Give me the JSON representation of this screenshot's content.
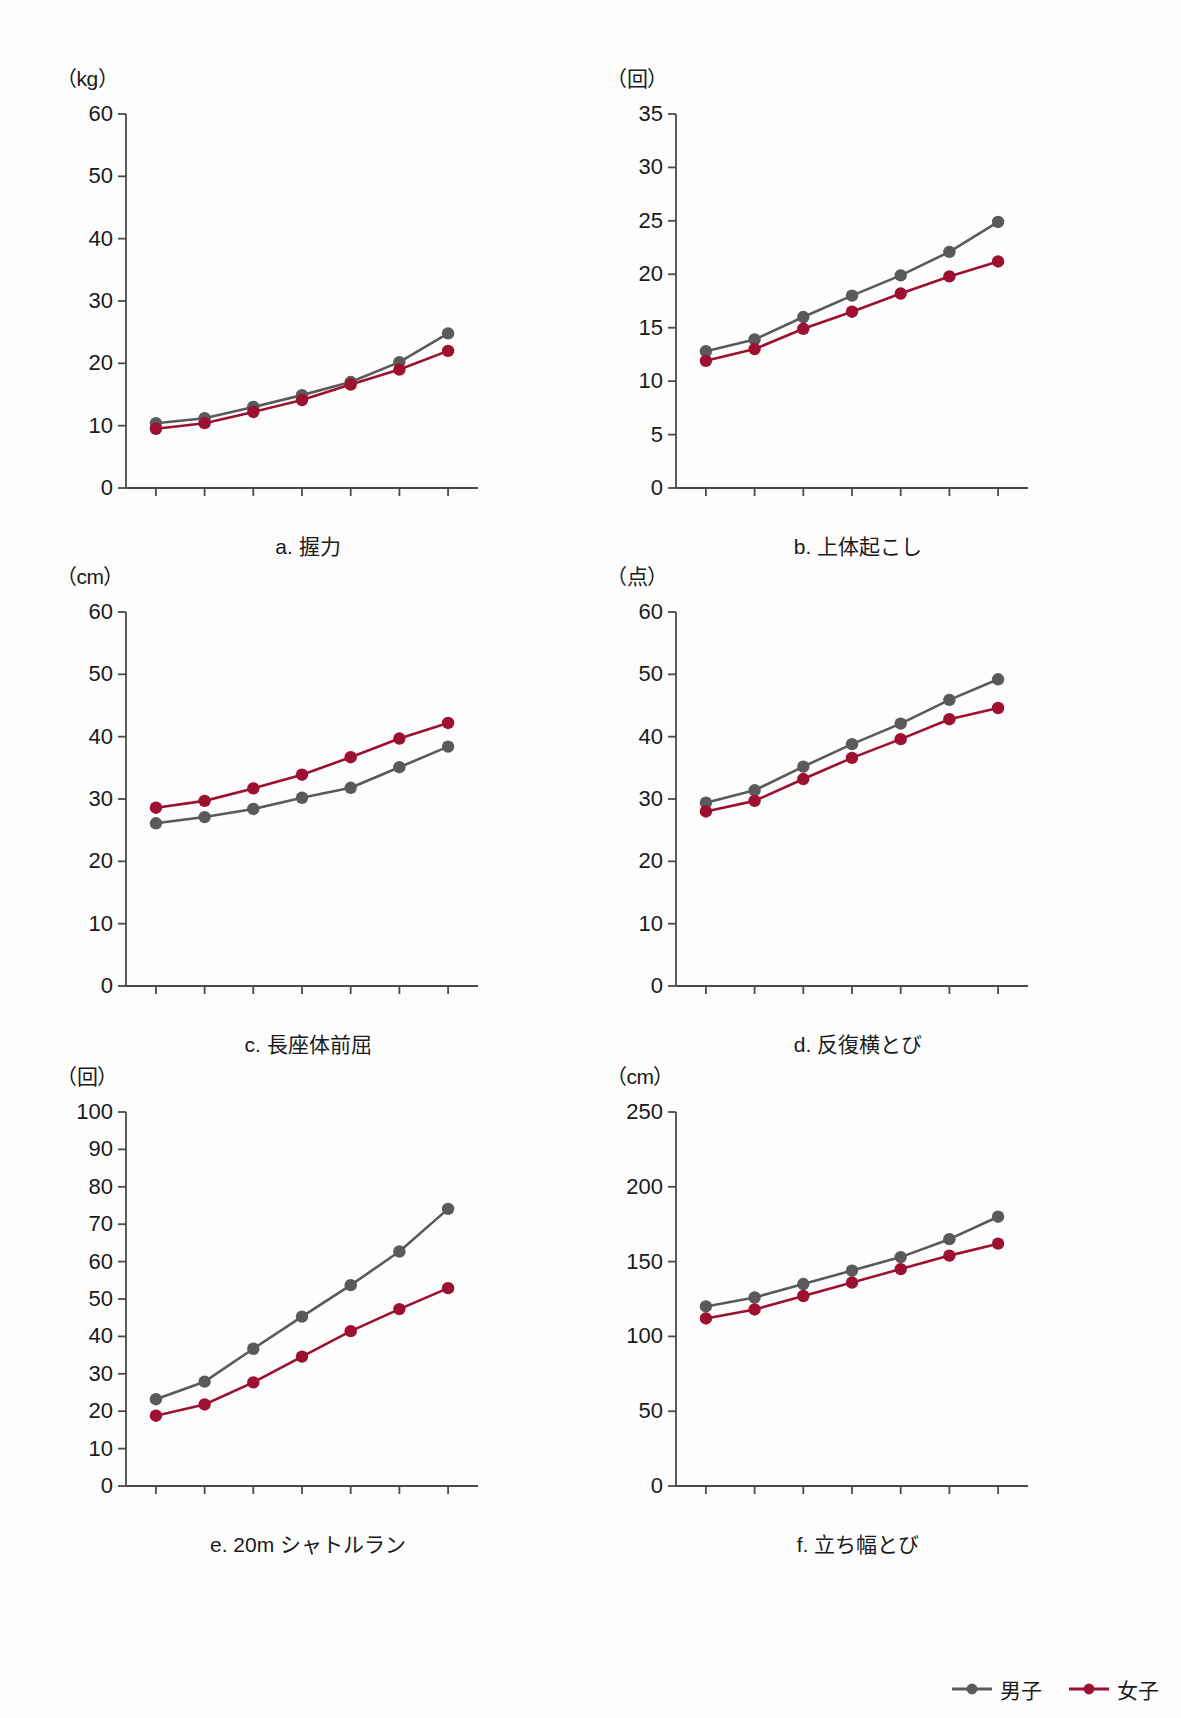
{
  "legend": {
    "items": [
      {
        "label": "男子",
        "color": "#5a5a5a",
        "key": "boys"
      },
      {
        "label": "女子",
        "color": "#9e1030",
        "key": "girls"
      }
    ]
  },
  "x_unit_label": "（歳）",
  "colors": {
    "boys": "#5a5a5a",
    "girls": "#9e1030",
    "axis": "#4a4a4a",
    "text": "#1a1a1a",
    "background": "#fdfdfd"
  },
  "chart_data": [
    {
      "id": "a",
      "type": "line",
      "title": "a. 握力",
      "ylabel": "（kg）",
      "xlabel": "（歳）",
      "x": [
        6,
        7,
        8,
        9,
        10,
        11,
        12
      ],
      "xticklabels": [
        "6",
        "7",
        "8",
        "9",
        "10",
        "11",
        "12"
      ],
      "yticks": [
        0,
        10,
        20,
        30,
        40,
        50,
        60
      ],
      "yticklabels": [
        "0",
        "10",
        "20",
        "30",
        "40",
        "50",
        "60"
      ],
      "ylim": [
        0,
        60
      ],
      "grid": false,
      "legend_position": "figure-bottom-right",
      "series": [
        {
          "name": "男子",
          "key": "boys",
          "values": [
            10.4,
            11.2,
            13.0,
            14.9,
            17.0,
            20.2,
            24.8
          ]
        },
        {
          "name": "女子",
          "key": "girls",
          "values": [
            9.5,
            10.4,
            12.2,
            14.1,
            16.6,
            19.0,
            22.0
          ]
        }
      ]
    },
    {
      "id": "b",
      "type": "line",
      "title": "b. 上体起こし",
      "ylabel": "（回）",
      "xlabel": "（歳）",
      "x": [
        6,
        7,
        8,
        9,
        10,
        11,
        12
      ],
      "xticklabels": [
        "6",
        "7",
        "8",
        "9",
        "10",
        "11",
        "12"
      ],
      "yticks": [
        0,
        5,
        10,
        15,
        20,
        25,
        30,
        35
      ],
      "yticklabels": [
        "0",
        "5",
        "10",
        "15",
        "20",
        "25",
        "30",
        "35"
      ],
      "ylim": [
        0,
        35
      ],
      "grid": false,
      "legend_position": "figure-bottom-right",
      "series": [
        {
          "name": "男子",
          "key": "boys",
          "values": [
            12.8,
            13.9,
            16.0,
            18.0,
            19.9,
            22.1,
            24.9
          ]
        },
        {
          "name": "女子",
          "key": "girls",
          "values": [
            11.9,
            13.0,
            14.9,
            16.5,
            18.2,
            19.8,
            21.2
          ]
        }
      ]
    },
    {
      "id": "c",
      "type": "line",
      "title": "c. 長座体前屈",
      "ylabel": "（cm）",
      "xlabel": "（歳）",
      "x": [
        6,
        7,
        8,
        9,
        10,
        11,
        12
      ],
      "xticklabels": [
        "6",
        "7",
        "8",
        "9",
        "10",
        "11",
        "12"
      ],
      "yticks": [
        0,
        10,
        20,
        30,
        40,
        50,
        60
      ],
      "yticklabels": [
        "0",
        "10",
        "20",
        "30",
        "40",
        "50",
        "60"
      ],
      "ylim": [
        0,
        60
      ],
      "grid": false,
      "legend_position": "figure-bottom-right",
      "series": [
        {
          "name": "男子",
          "key": "boys",
          "values": [
            26.1,
            27.1,
            28.4,
            30.2,
            31.8,
            35.1,
            38.4
          ]
        },
        {
          "name": "女子",
          "key": "girls",
          "values": [
            28.6,
            29.7,
            31.7,
            33.9,
            36.7,
            39.7,
            42.2
          ]
        }
      ]
    },
    {
      "id": "d",
      "type": "line",
      "title": "d. 反復横とび",
      "ylabel": "（点）",
      "xlabel": "（歳）",
      "x": [
        6,
        7,
        8,
        9,
        10,
        11,
        12
      ],
      "xticklabels": [
        "6",
        "7",
        "8",
        "9",
        "10",
        "11",
        "12"
      ],
      "yticks": [
        0,
        10,
        20,
        30,
        40,
        50,
        60
      ],
      "yticklabels": [
        "0",
        "10",
        "20",
        "30",
        "40",
        "50",
        "60"
      ],
      "ylim": [
        0,
        60
      ],
      "grid": false,
      "legend_position": "figure-bottom-right",
      "series": [
        {
          "name": "男子",
          "key": "boys",
          "values": [
            29.4,
            31.4,
            35.2,
            38.8,
            42.1,
            45.9,
            49.2
          ]
        },
        {
          "name": "女子",
          "key": "girls",
          "values": [
            28.0,
            29.7,
            33.2,
            36.6,
            39.6,
            42.8,
            44.6
          ]
        }
      ]
    },
    {
      "id": "e",
      "type": "line",
      "title": "e. 20m シャトルラン",
      "ylabel": "（回）",
      "xlabel": "（歳）",
      "x": [
        6,
        7,
        8,
        9,
        10,
        11,
        12
      ],
      "xticklabels": [
        "6",
        "7",
        "8",
        "9",
        "10",
        "11",
        "12"
      ],
      "yticks": [
        0,
        10,
        20,
        30,
        40,
        50,
        60,
        70,
        80,
        90,
        100
      ],
      "yticklabels": [
        "0",
        "10",
        "20",
        "30",
        "40",
        "50",
        "60",
        "70",
        "80",
        "90",
        "100"
      ],
      "ylim": [
        0,
        100
      ],
      "grid": false,
      "legend_position": "figure-bottom-right",
      "series": [
        {
          "name": "男子",
          "key": "boys",
          "values": [
            23.2,
            27.9,
            36.7,
            45.3,
            53.7,
            62.7,
            74.1
          ]
        },
        {
          "name": "女子",
          "key": "girls",
          "values": [
            18.8,
            21.8,
            27.7,
            34.6,
            41.4,
            47.3,
            52.9
          ]
        }
      ]
    },
    {
      "id": "f",
      "type": "line",
      "title": "f. 立ち幅とび",
      "ylabel": "（cm）",
      "xlabel": "（歳）",
      "x": [
        6,
        7,
        8,
        9,
        10,
        11,
        12
      ],
      "xticklabels": [
        "6",
        "7",
        "8",
        "9",
        "10",
        "11",
        "12"
      ],
      "yticks": [
        0,
        50,
        100,
        150,
        200,
        250
      ],
      "yticklabels": [
        "0",
        "50",
        "100",
        "150",
        "200",
        "250"
      ],
      "ylim": [
        0,
        250
      ],
      "grid": false,
      "legend_position": "figure-bottom-right",
      "series": [
        {
          "name": "男子",
          "key": "boys",
          "values": [
            120,
            126,
            135,
            144,
            153,
            165,
            180
          ]
        },
        {
          "name": "女子",
          "key": "girls",
          "values": [
            112,
            118,
            127,
            136,
            145,
            154,
            162
          ]
        }
      ]
    }
  ]
}
